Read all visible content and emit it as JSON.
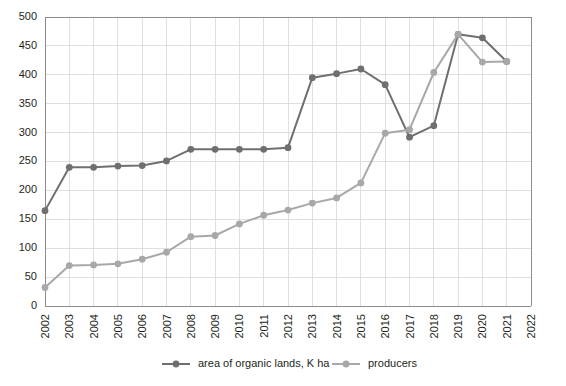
{
  "chart_data": {
    "type": "line",
    "title": "",
    "xlabel": "",
    "ylabel": "",
    "ylim": [
      0,
      500
    ],
    "ytick_step": 50,
    "ytick_labels": [
      "0",
      "50",
      "100",
      "150",
      "200",
      "250",
      "300",
      "350",
      "400",
      "450",
      "500"
    ],
    "grid": true,
    "legend_position": "bottom",
    "categories": [
      "2002",
      "2003",
      "2004",
      "2005",
      "2006",
      "2007",
      "2008",
      "2009",
      "2010",
      "2011",
      "2012",
      "2013",
      "2014",
      "2015",
      "2016",
      "2017",
      "2018",
      "2019",
      "2020",
      "2021",
      "2022"
    ],
    "series": [
      {
        "name": "area of organic lands, K ha",
        "color": "#6f6f71",
        "values": [
          165,
          240,
          240,
          242,
          243,
          251,
          271,
          271,
          271,
          271,
          274,
          395,
          402,
          410,
          383,
          292,
          312,
          470,
          464,
          423,
          null
        ]
      },
      {
        "name": "producers",
        "color": "#a8a8aa",
        "values": [
          32,
          70,
          71,
          73,
          81,
          93,
          120,
          122,
          142,
          157,
          166,
          178,
          187,
          213,
          299,
          305,
          404,
          470,
          422,
          423,
          null
        ]
      }
    ]
  },
  "legend": {
    "items": [
      {
        "label": "area of organic lands, K ha",
        "color": "#6f6f71"
      },
      {
        "label": "producers",
        "color": "#a8a8aa"
      }
    ]
  },
  "colors": {
    "grid": "#d7d7d9",
    "axis": "#8d8d8f",
    "text": "#231f20",
    "background": "#ffffff",
    "series_dark": "#6f6f71",
    "series_light": "#a8a8aa"
  }
}
